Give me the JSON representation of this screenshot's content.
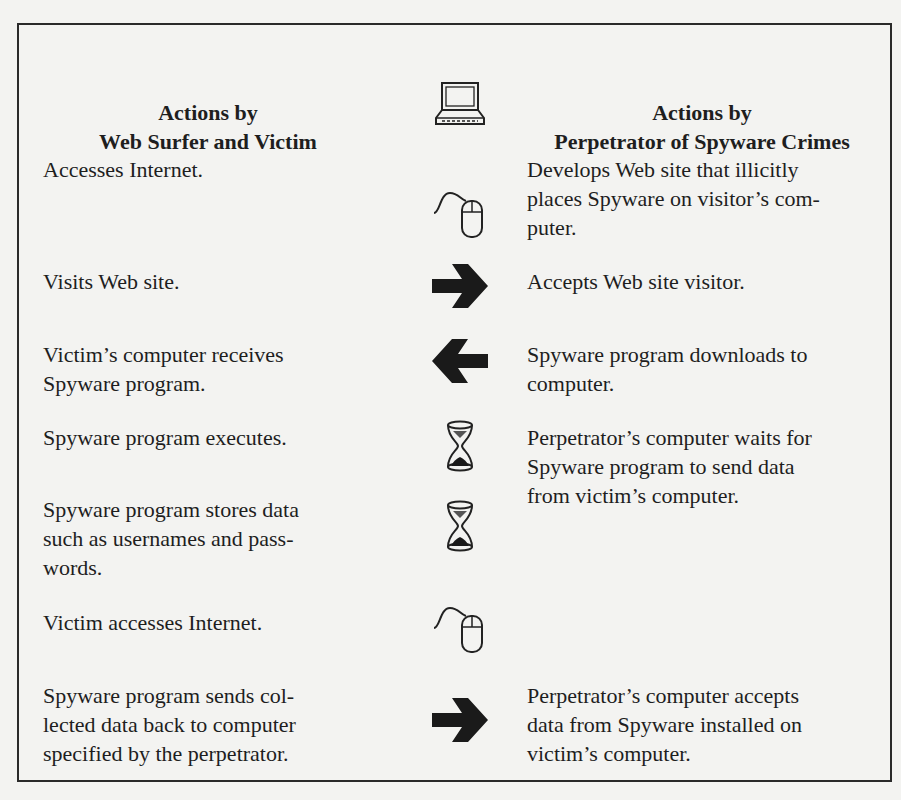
{
  "headers": {
    "left": [
      "Actions by",
      "Web Surfer and Victim"
    ],
    "right": [
      "Actions by",
      "Perpetrator of Spyware Crimes"
    ]
  },
  "rows": [
    {
      "left": "Accesses Internet.",
      "icon": "computer-icon",
      "right": ""
    },
    {
      "left": "",
      "icon": "mouse-icon",
      "right": "Develops Web site that illicitly places Spyware on visitor's com- puter."
    },
    {
      "left": "Visits Web site.",
      "icon": "arrow-right-icon",
      "right": "Accepts Web site visitor."
    },
    {
      "left": "Victim's computer receives Spyware program.",
      "icon": "arrow-left-icon",
      "right": "Spyware program downloads to computer."
    },
    {
      "left": "Spyware program executes.",
      "icon": "hourglass-icon",
      "right": "Perpetrator's computer waits for Spyware program to send data from victim's computer."
    },
    {
      "left": "Spyware program stores data such as usernames and pass- words.",
      "icon": "hourglass-icon",
      "right": ""
    },
    {
      "left": "Victim accesses Internet.",
      "icon": "mouse-icon",
      "right": ""
    },
    {
      "left": "Spyware program sends col- lected data back to computer specified by the perpetrator.",
      "icon": "arrow-right-icon",
      "right": "Perpetrator's computer accepts data from Spyware installed on victim's computer."
    }
  ],
  "lines": {
    "h_left_1": "Actions by",
    "h_left_2": "Web Surfer and Victim",
    "h_right_1": "Actions by",
    "h_right_2": "Perpetrator of Spyware Crimes",
    "l0": [
      "Accesses Internet."
    ],
    "r1": [
      "Develops Web site that illicitly",
      "places Spyware on visitor’s com-",
      "puter."
    ],
    "l2": [
      "Visits Web site."
    ],
    "r2": [
      "Accepts Web site visitor."
    ],
    "l3": [
      "Victim’s computer receives",
      "Spyware program."
    ],
    "r3": [
      "Spyware program downloads to",
      "computer."
    ],
    "l4": [
      "Spyware program executes."
    ],
    "r4": [
      "Perpetrator’s computer waits for",
      "Spyware program to send data",
      "from victim’s computer."
    ],
    "l5": [
      "Spyware program stores data",
      "such as usernames and pass-",
      "words."
    ],
    "l6": [
      "Victim accesses Internet."
    ],
    "l7": [
      "Spyware program sends col-",
      "lected data back to computer",
      "specified by the perpetrator."
    ],
    "r7": [
      "Perpetrator’s computer accepts",
      "data from Spyware installed on",
      "victim’s computer."
    ]
  },
  "colors": {
    "ink": "#1e1e1e",
    "paper": "#f3f3f1",
    "border": "#2a2a2a"
  }
}
